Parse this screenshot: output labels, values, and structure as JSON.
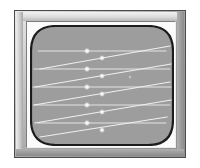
{
  "figure": {
    "kind": "crt-monitor-raster-display",
    "background_color": "#ffffff"
  },
  "monitor": {
    "case_border_color": "#4b4b4b",
    "bezel_light_color": "#e9e9e9",
    "bezel_dark_color": "#8f8f8f",
    "mat_color": "#fbfbfb"
  },
  "screen": {
    "label": "crt-screen",
    "phosphor_color": "#9d9d9d",
    "outline_color": "#1c1c1c",
    "trace_color": "#f0f0f0",
    "spot_color": "#ffffff",
    "corner_radius": 26,
    "width": 144,
    "height": 121
  },
  "chart_data": {
    "type": "line",
    "xlabel": "",
    "ylabel": "",
    "xlim": [
      0,
      144
    ],
    "ylim": [
      0,
      121
    ],
    "grid": false,
    "legend": "none",
    "series": [
      {
        "name": "scan-line-1",
        "kind": "horizontal-trace",
        "x": [
          8,
          136
        ],
        "y": [
          26,
          26
        ]
      },
      {
        "name": "scan-line-2",
        "kind": "horizontal-trace",
        "x": [
          4,
          140
        ],
        "y": [
          44,
          44
        ]
      },
      {
        "name": "scan-line-3",
        "kind": "horizontal-trace",
        "x": [
          3,
          141
        ],
        "y": [
          62,
          62
        ]
      },
      {
        "name": "scan-line-4",
        "kind": "horizontal-trace",
        "x": [
          4,
          140
        ],
        "y": [
          80,
          80
        ]
      },
      {
        "name": "scan-line-5",
        "kind": "horizontal-trace",
        "x": [
          8,
          136
        ],
        "y": [
          98,
          98
        ]
      },
      {
        "name": "sweep-1",
        "kind": "diagonal-trace",
        "x": [
          10,
          140
        ],
        "y": [
          44,
          21
        ]
      },
      {
        "name": "sweep-2",
        "kind": "diagonal-trace",
        "x": [
          5,
          141
        ],
        "y": [
          62,
          39
        ]
      },
      {
        "name": "sweep-3",
        "kind": "diagonal-trace",
        "x": [
          4,
          140
        ],
        "y": [
          80,
          57
        ]
      },
      {
        "name": "sweep-4",
        "kind": "diagonal-trace",
        "x": [
          5,
          141
        ],
        "y": [
          98,
          75
        ]
      },
      {
        "name": "sweep-5",
        "kind": "diagonal-trace",
        "x": [
          10,
          137
        ],
        "y": [
          112,
          92
        ]
      }
    ],
    "spots": [
      {
        "name": "beam-spot-1",
        "x": 57,
        "y": 26,
        "r": 3.2
      },
      {
        "name": "beam-spot-2",
        "x": 72,
        "y": 33,
        "r": 3.0
      },
      {
        "name": "beam-spot-3",
        "x": 57,
        "y": 44,
        "r": 3.2
      },
      {
        "name": "beam-spot-4",
        "x": 72,
        "y": 51,
        "r": 3.0
      },
      {
        "name": "beam-spot-5",
        "x": 57,
        "y": 62,
        "r": 3.2
      },
      {
        "name": "beam-spot-6",
        "x": 72,
        "y": 69,
        "r": 3.0
      },
      {
        "name": "beam-spot-7",
        "x": 57,
        "y": 80,
        "r": 3.2
      },
      {
        "name": "beam-spot-8",
        "x": 72,
        "y": 87,
        "r": 3.0
      },
      {
        "name": "beam-spot-9",
        "x": 57,
        "y": 98,
        "r": 3.2
      },
      {
        "name": "beam-spot-10",
        "x": 72,
        "y": 105,
        "r": 3.0
      }
    ],
    "noise_speck": {
      "name": "phosphor-speck",
      "x": 100,
      "y": 52,
      "r": 1.2
    }
  }
}
